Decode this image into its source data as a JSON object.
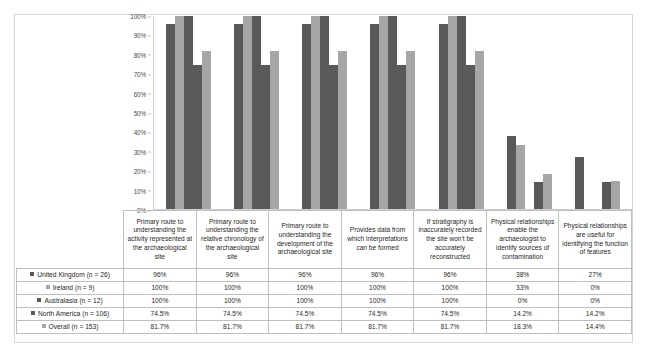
{
  "chart_data": {
    "type": "bar",
    "title": "",
    "xlabel": "",
    "ylabel": "",
    "ylim": [
      0,
      100
    ],
    "grid": false,
    "legend_position": "table-left",
    "ytick_labels": [
      "100%",
      "90%",
      "80%",
      "70%",
      "60%",
      "50%",
      "40%",
      "30%",
      "20%",
      "10%",
      "0%"
    ],
    "ytick_values": [
      100,
      90,
      80,
      70,
      60,
      50,
      40,
      30,
      20,
      10,
      0
    ],
    "categories": [
      "Primary route to understanding the activity represented at the archaeological site",
      "Primary route to understanding the relative chronology of the archaeological site",
      "Primary route to understanding the development of the archaeological site",
      "Provides data from which interpretations can be formed",
      "If stratigraphy is inaccurately recorded the site won't be accurately reconstructed",
      "Physical relationships enable the archaeologist to identify sources of contamination",
      "Physical relationships are useful for identifying the function of features"
    ],
    "series": [
      {
        "name": "United Kingdom (n = 26)",
        "color": "#595959",
        "values": [
          96,
          96,
          96,
          96,
          96,
          38,
          27
        ],
        "labels": [
          "96%",
          "96%",
          "96%",
          "96%",
          "96%",
          "38%",
          "27%"
        ]
      },
      {
        "name": "Ireland (n = 9)",
        "color": "#a6a6a6",
        "values": [
          100,
          100,
          100,
          100,
          100,
          33,
          0
        ],
        "labels": [
          "100%",
          "100%",
          "100%",
          "100%",
          "100%",
          "33%",
          "0%"
        ]
      },
      {
        "name": "Australasia (n = 12)",
        "color": "#595959",
        "values": [
          100,
          100,
          100,
          100,
          100,
          0,
          0
        ],
        "labels": [
          "100%",
          "100%",
          "100%",
          "100%",
          "100%",
          "0%",
          "0%"
        ]
      },
      {
        "name": "North America (n = 106)",
        "color": "#595959",
        "values": [
          74.5,
          74.5,
          74.5,
          74.5,
          74.5,
          14.2,
          14.2
        ],
        "labels": [
          "74.5%",
          "74.5%",
          "74.5%",
          "74.5%",
          "74.5%",
          "14.2%",
          "14.2%"
        ]
      },
      {
        "name": "Overall (n = 153)",
        "color": "#a6a6a6",
        "values": [
          81.7,
          81.7,
          81.7,
          81.7,
          81.7,
          18.3,
          14.4
        ],
        "labels": [
          "81.7%",
          "81.7%",
          "81.7%",
          "81.7%",
          "81.7%",
          "18.3%",
          "14.4%"
        ]
      }
    ]
  }
}
